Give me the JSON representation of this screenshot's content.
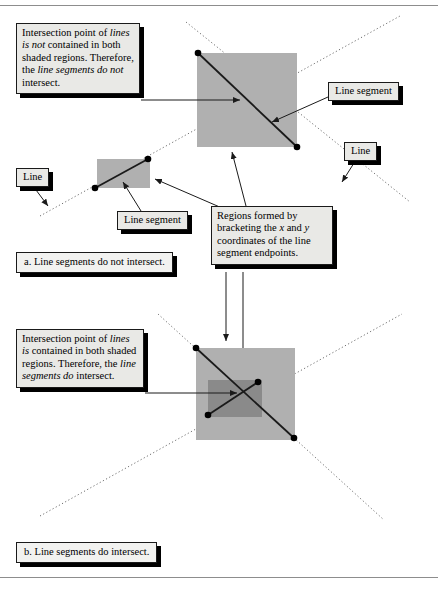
{
  "figure": {
    "title_visible": false,
    "background": "#ffffff",
    "rule_color": "#8d8d8d",
    "shade_light": "#b0b0b0",
    "shade_dark": "#8a8a8a",
    "line_color": "#1a1a1a"
  },
  "panel_a": {
    "caption": "a. Line segments do not intersect.",
    "explanation": {
      "seg1": "Intersection point of ",
      "seg2_italic": "lines is not",
      "seg3": " contained in both shaded regions. Therefore, the ",
      "seg4_italic": "line segments do not",
      "seg5": " intersect."
    },
    "labels": {
      "line_segment_right": "Line segment",
      "line_right": "Line",
      "line_left": "Line",
      "line_segment_left": "Line segment"
    },
    "regions_note": {
      "seg1": "Regions formed by bracketing the ",
      "seg2_italic": "x",
      "seg3": " and ",
      "seg4_italic": "y",
      "seg5": " coordinates of the line segment endpoints."
    }
  },
  "panel_b": {
    "caption": "b. Line segments do intersect.",
    "explanation": {
      "seg1": "Intersection point of ",
      "seg2_italic": "lines is",
      "seg3": " contained in both shaded regions. Therefore, the ",
      "seg4_italic": "line segments do",
      "seg5": " intersect."
    }
  },
  "geometry": {
    "panel_a": {
      "region_big": {
        "x": 197,
        "y": 53,
        "w": 100,
        "h": 94
      },
      "region_small": {
        "x": 97,
        "y": 159,
        "w": 53,
        "h": 29
      },
      "segment_big": {
        "x1": 198,
        "y1": 53,
        "x2": 297,
        "y2": 147
      },
      "segment_small": {
        "x1": 95,
        "y1": 188,
        "x2": 148,
        "y2": 159
      },
      "line_down_right": {
        "x1": 186,
        "y1": 22,
        "x2": 408,
        "y2": 200
      },
      "line_up_right": {
        "x1": 48,
        "y1": 212,
        "x2": 398,
        "y2": 18
      }
    },
    "panel_b": {
      "region_light": {
        "x": 196,
        "y": 348,
        "w": 99,
        "h": 92
      },
      "region_dark": {
        "x": 208,
        "y": 380,
        "w": 54,
        "h": 37
      },
      "segment_1": {
        "x1": 196,
        "y1": 348,
        "x2": 294,
        "y2": 438
      },
      "segment_2": {
        "x1": 208,
        "y1": 415,
        "x2": 258,
        "y2": 382
      },
      "line_down_right": {
        "x1": 160,
        "y1": 316,
        "x2": 380,
        "y2": 516
      },
      "line_up_right": {
        "x1": 44,
        "y1": 512,
        "x2": 398,
        "y2": 316
      }
    }
  }
}
